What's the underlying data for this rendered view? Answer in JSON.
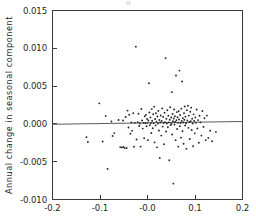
{
  "figure": {
    "background_color": "#ffffff",
    "frame_color": "#3a3a3a",
    "point_color": "#262626",
    "line_color": "#5a5a5a"
  },
  "axes": {
    "y_title": "Annual change in seasonal component",
    "x_title": "",
    "x_ticklabels": [
      "-0.2",
      "-0.1",
      "-0.0",
      "0.1",
      "0.2"
    ],
    "y_ticklabels": [
      "0.015",
      "0.010",
      "0.005",
      "0.000",
      "-0.005",
      "-0.010"
    ]
  },
  "chart_data": {
    "type": "scatter",
    "title": "",
    "xlabel": "",
    "ylabel": "Annual change in seasonal component",
    "xlim": [
      -0.2,
      0.2
    ],
    "ylim": [
      -0.01,
      0.015
    ],
    "xticks": [
      -0.2,
      -0.1,
      -0.0,
      0.1,
      0.2
    ],
    "yticks": [
      0.015,
      0.01,
      0.005,
      0.0,
      -0.005,
      -0.01
    ],
    "xtick_labels": [
      "-0.2",
      "-0.1",
      "-0.0",
      "0.1",
      "0.2"
    ],
    "ytick_labels": [
      "0.015",
      "0.010",
      "0.005",
      "0.000",
      "-0.005",
      "-0.010"
    ],
    "grid": false,
    "legend": null,
    "frame": "box",
    "series": [
      {
        "name": "observations",
        "marker": "dot",
        "points": [
          [
            -0.1285,
            -0.00175
          ],
          [
            -0.1255,
            -0.0024
          ],
          [
            -0.1015,
            0.00272
          ],
          [
            -0.0945,
            -0.00232
          ],
          [
            -0.088,
            0.00106
          ],
          [
            -0.084,
            -0.00595
          ],
          [
            -0.076,
            0.00031
          ],
          [
            -0.0735,
            -0.0016
          ],
          [
            -0.07,
            -0.00122
          ],
          [
            -0.061,
            0.00052
          ],
          [
            -0.0575,
            -0.00307
          ],
          [
            -0.054,
            -0.00312
          ],
          [
            -0.0515,
            0.00045
          ],
          [
            -0.0505,
            -0.00305
          ],
          [
            -0.048,
            -0.0032
          ],
          [
            -0.046,
            0.00092
          ],
          [
            -0.044,
            -0.00318
          ],
          [
            -0.042,
            0.00176
          ],
          [
            -0.04,
            -0.00048
          ],
          [
            -0.0385,
            0.00122
          ],
          [
            -0.036,
            -0.0013
          ],
          [
            -0.034,
            0.00018
          ],
          [
            -0.0325,
            -0.00092
          ],
          [
            -0.03,
            0.00142
          ],
          [
            -0.0285,
            -0.00302
          ],
          [
            -0.0265,
            0.00014
          ],
          [
            -0.0245,
            0.01022
          ],
          [
            -0.023,
            -0.00206
          ],
          [
            -0.0205,
            0.00022
          ],
          [
            -0.019,
            0.00135
          ],
          [
            -0.0175,
            -0.00028
          ],
          [
            -0.016,
            6e-05
          ],
          [
            -0.0145,
            -0.003
          ],
          [
            -0.013,
            0.00198
          ],
          [
            -0.0115,
            0.00045
          ],
          [
            -0.01,
            -0.00062
          ],
          [
            -0.0085,
            0.00014
          ],
          [
            -0.007,
            -0.0019
          ],
          [
            -0.0058,
            0.00102
          ],
          [
            -0.0045,
            8e-05
          ],
          [
            -0.0032,
            0.0012
          ],
          [
            -0.002,
            -0.00032
          ],
          [
            -0.001,
            0.00066
          ],
          [
            0.0,
            0.00014
          ],
          [
            0.0008,
            -0.00215
          ],
          [
            0.0018,
            0.00045
          ],
          [
            0.003,
            0.00538
          ],
          [
            0.004,
            0.0015
          ],
          [
            0.005,
            -0.00018
          ],
          [
            0.0062,
            0.00086
          ],
          [
            0.007,
            0.00012
          ],
          [
            0.008,
            -0.0012
          ],
          [
            0.009,
            0.00196
          ],
          [
            0.0098,
            0.00042
          ],
          [
            0.011,
            -0.00058
          ],
          [
            0.012,
            0.00128
          ],
          [
            0.0128,
            0.0001
          ],
          [
            0.014,
            0.00228
          ],
          [
            0.0148,
            -0.00245
          ],
          [
            0.016,
            0.00064
          ],
          [
            0.017,
            -0.0002
          ],
          [
            0.0178,
            0.0014
          ],
          [
            0.019,
            0.0003
          ],
          [
            0.02,
            -0.0031
          ],
          [
            0.0208,
            0.00098
          ],
          [
            0.022,
            4e-05
          ],
          [
            0.0228,
            0.00172
          ],
          [
            0.024,
            -0.00088
          ],
          [
            0.025,
            0.00052
          ],
          [
            0.0258,
            -0.0045
          ],
          [
            0.0268,
            0.00018
          ],
          [
            0.028,
            0.00112
          ],
          [
            0.029,
            -0.00155
          ],
          [
            0.03,
            0.0004
          ],
          [
            0.031,
            0.00205
          ],
          [
            0.032,
            -0.00036
          ],
          [
            0.033,
            0.00092
          ],
          [
            0.034,
            0.00012
          ],
          [
            0.035,
            -0.00268
          ],
          [
            0.036,
            0.00148
          ],
          [
            0.037,
            0.00024
          ],
          [
            0.038,
            0.0087
          ],
          [
            0.039,
            -0.001
          ],
          [
            0.0398,
            0.00068
          ],
          [
            0.0408,
            6e-05
          ],
          [
            0.0418,
            0.0018
          ],
          [
            0.0428,
            -0.00045
          ],
          [
            0.0438,
            0.00108
          ],
          [
            0.0448,
            0.0002
          ],
          [
            0.0458,
            -0.0048
          ],
          [
            0.0468,
            0.00055
          ],
          [
            0.0478,
            0.0022
          ],
          [
            0.0488,
            -0.00015
          ],
          [
            0.0498,
            0.00084
          ],
          [
            0.0505,
            2e-05
          ],
          [
            0.0512,
            0.0042
          ],
          [
            0.052,
            -0.0014
          ],
          [
            0.0528,
            0.0013
          ],
          [
            0.0536,
            0.00036
          ],
          [
            0.0544,
            -0.0079
          ],
          [
            0.0552,
            0.00072
          ],
          [
            0.056,
            0.0019
          ],
          [
            0.0568,
            -8e-05
          ],
          [
            0.0576,
            0.00102
          ],
          [
            0.0584,
            0.00026
          ],
          [
            0.0592,
            -0.00215
          ],
          [
            0.06,
            0.0064
          ],
          [
            0.0608,
            0.00048
          ],
          [
            0.0616,
            0.00156
          ],
          [
            0.0624,
            -0.00068
          ],
          [
            0.0632,
            0.00088
          ],
          [
            0.064,
            0.00014
          ],
          [
            0.0648,
            -0.003
          ],
          [
            0.0656,
            0.00168
          ],
          [
            0.0664,
            0.00058
          ],
          [
            0.0672,
            0.00705
          ],
          [
            0.068,
            -0.0003
          ],
          [
            0.0688,
            0.00118
          ],
          [
            0.0696,
            0.0001
          ],
          [
            0.0704,
            -0.00182
          ],
          [
            0.0712,
            0.00202
          ],
          [
            0.072,
            0.0004
          ],
          [
            0.0728,
            0.0056
          ],
          [
            0.0736,
            -0.00098
          ],
          [
            0.0744,
            0.00076
          ],
          [
            0.0752,
            0.00018
          ],
          [
            0.076,
            -0.00262
          ],
          [
            0.0768,
            0.0014
          ],
          [
            0.0776,
            0.00054
          ],
          [
            0.0784,
            0.0023
          ],
          [
            0.0792,
            -0.00022
          ],
          [
            0.08,
            0.00096
          ],
          [
            0.081,
            8e-05
          ],
          [
            0.082,
            -0.0033
          ],
          [
            0.083,
            0.00182
          ],
          [
            0.084,
            0.00044
          ],
          [
            0.085,
            0.0024
          ],
          [
            0.086,
            -0.00052
          ],
          [
            0.087,
            0.0011
          ],
          [
            0.088,
            0.00024
          ],
          [
            0.089,
            -0.002
          ],
          [
            0.09,
            0.0016
          ],
          [
            0.091,
            0.00036
          ],
          [
            0.092,
            0.00215
          ],
          [
            0.093,
            -0.0008
          ],
          [
            0.094,
            0.00068
          ],
          [
            0.095,
            6e-05
          ],
          [
            0.096,
            -0.00295
          ],
          [
            0.097,
            0.00126
          ],
          [
            0.0982,
            0.0004
          ],
          [
            0.0995,
            -0.00125
          ],
          [
            0.1008,
            0.00086
          ],
          [
            0.102,
            0.00014
          ],
          [
            0.1035,
            0.0019
          ],
          [
            0.105,
            -0.0006
          ],
          [
            0.1065,
            0.0005
          ],
          [
            0.108,
            -0.0025
          ],
          [
            0.1095,
            0.00108
          ],
          [
            0.1115,
            0.0002
          ],
          [
            0.1135,
            -0.00155
          ],
          [
            0.1155,
            0.0017
          ],
          [
            0.118,
            -0.0004
          ],
          [
            0.12,
            0.00074
          ],
          [
            0.1225,
            -0.00215
          ],
          [
            0.125,
            0.0011
          ],
          [
            0.128,
            -0.00185
          ],
          [
            0.132,
            -0.0009
          ],
          [
            0.136,
            -0.0023
          ],
          [
            0.144,
            -0.00105
          ]
        ]
      }
    ],
    "fit_line": {
      "name": "regression-line",
      "x_start": -0.2,
      "y_start": -5e-05,
      "x_end": 0.2,
      "y_end": 0.00032
    }
  }
}
